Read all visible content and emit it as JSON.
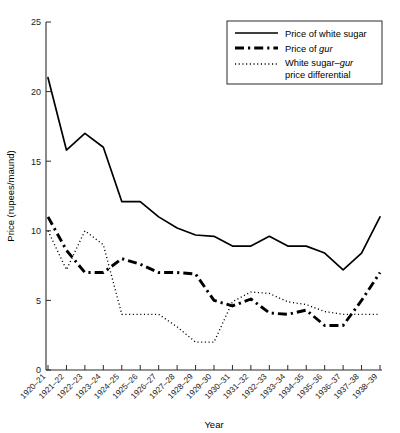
{
  "chart_data": {
    "type": "line",
    "title": "",
    "xlabel": "Year",
    "ylabel": "Price (rupees/maund)",
    "ylim": [
      0,
      25
    ],
    "yticks": [
      0,
      5,
      10,
      15,
      20,
      25
    ],
    "ytick_labels": [
      "0",
      "5",
      "10",
      "15",
      "20",
      "25"
    ],
    "grid": false,
    "legend_position": "top-right",
    "categories": [
      "1920–21",
      "1921–22",
      "1922–23",
      "1923–24",
      "1924–25",
      "1925–26",
      "1926–27",
      "1927–28",
      "1928–29",
      "1929–30",
      "1930–31",
      "1931–32",
      "1932–33",
      "1933–34",
      "1934–35",
      "1935–36",
      "1936–37",
      "1937–38",
      "1938–39"
    ],
    "series": [
      {
        "name": "Price of white sugar",
        "line_style": "solid",
        "color": "#000000",
        "values": [
          21.0,
          15.8,
          17.0,
          16.0,
          12.1,
          12.1,
          11.0,
          10.2,
          9.7,
          9.6,
          8.9,
          8.9,
          9.6,
          8.9,
          8.9,
          8.4,
          7.2,
          8.4,
          11.0
        ]
      },
      {
        "name": "Price of gur",
        "line_style": "dash-dot",
        "color": "#000000",
        "values": [
          11.0,
          8.6,
          7.0,
          7.0,
          8.0,
          7.6,
          7.0,
          7.0,
          6.9,
          5.0,
          4.6,
          5.1,
          4.1,
          4.0,
          4.3,
          3.2,
          3.2,
          5.0,
          7.0
        ]
      },
      {
        "name": "White sugar–gur price differential",
        "line_style": "dotted",
        "color": "#000000",
        "values": [
          10.0,
          7.2,
          10.0,
          9.0,
          4.0,
          4.0,
          4.0,
          3.1,
          2.0,
          2.0,
          4.9,
          5.6,
          5.5,
          4.9,
          4.7,
          4.2,
          4.0,
          4.0,
          4.0
        ]
      }
    ]
  },
  "legend": {
    "entries": [
      {
        "label": "Price of white sugar",
        "style": "solid"
      },
      {
        "label_prefix": "Price of ",
        "label_italic": "gur",
        "label_suffix": "",
        "style": "dash-dot"
      },
      {
        "label_line1_prefix": "White sugar–",
        "label_line1_italic": "gur",
        "label_line2": "price differential",
        "style": "dotted"
      }
    ]
  },
  "axes": {
    "y_title": "Price (rupees/maund)",
    "x_title": "Year"
  }
}
